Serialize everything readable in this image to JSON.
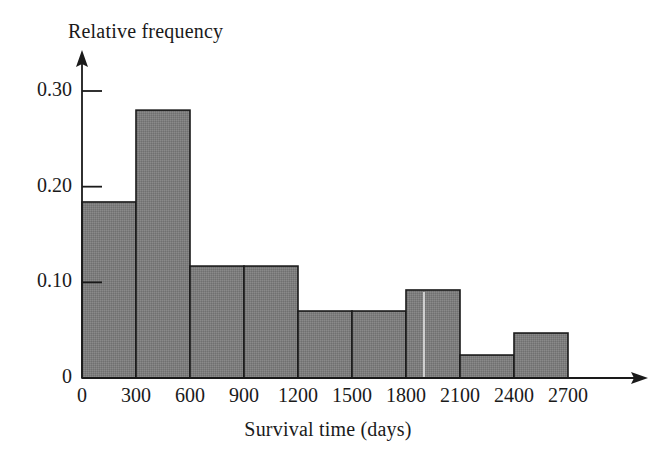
{
  "chart_data": {
    "type": "bar",
    "title": "",
    "subtitle": "",
    "xlabel": "Survival time (days)",
    "ylabel": "Relative frequency",
    "bin_width": 300,
    "bin_edges": [
      0,
      300,
      600,
      900,
      1200,
      1500,
      1800,
      2100,
      2400,
      2700
    ],
    "categories": [
      "0-300",
      "300-600",
      "600-900",
      "900-1200",
      "1200-1500",
      "1500-1800",
      "1800-2100",
      "2100-2400",
      "2400-2700"
    ],
    "values": [
      0.184,
      0.28,
      0.117,
      0.117,
      0.07,
      0.07,
      0.092,
      0.024,
      0.047
    ],
    "xlim": [
      0,
      2700
    ],
    "ylim": [
      0,
      0.3
    ],
    "xticks": [
      0,
      300,
      600,
      900,
      1200,
      1500,
      1800,
      2100,
      2400,
      2700
    ],
    "xtick_labels": [
      "0",
      "300",
      "600",
      "900",
      "1200",
      "1500",
      "1800",
      "2100",
      "2400",
      "2700"
    ],
    "yticks": [
      0,
      0.1,
      0.2,
      0.3
    ],
    "ytick_labels": [
      "0",
      "0.10",
      "0.20",
      "0.30"
    ],
    "grid": false,
    "legend": null,
    "bar_fill_color": "#7d7d7d",
    "bar_edge_color": "#1a1a1a",
    "axis_color": "#1a1a1a",
    "axis_arrows": true
  },
  "axes": {
    "y_title": "Relative frequency",
    "x_title": "Survival time (days)"
  }
}
